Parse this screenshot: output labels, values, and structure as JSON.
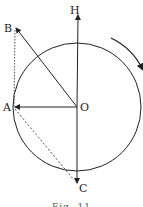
{
  "figure": {
    "labels": {
      "H": "H",
      "B": "B",
      "O": "O",
      "A": "A",
      "C": "C"
    },
    "caption": "Fig. 11",
    "colors": {
      "ink": "#222222",
      "background": "#ffffff"
    }
  }
}
